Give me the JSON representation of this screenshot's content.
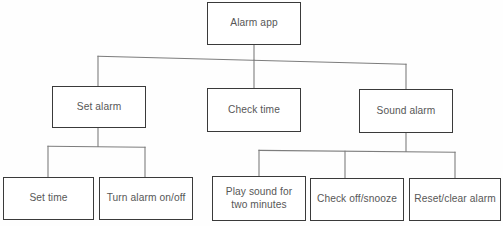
{
  "diagram": {
    "type": "hierarchy-tree",
    "title": "Alarm app",
    "orientation": "top-down",
    "levels": 3,
    "colors": {
      "box_border": "#3a3a3a",
      "box_fill": "#ffffff",
      "text": "#575757",
      "connector": "#7d7d7d",
      "background": "#fefefe"
    },
    "nodes": {
      "root": {
        "label": "Alarm app"
      },
      "set_alarm": {
        "label": "Set alarm"
      },
      "check_time": {
        "label": "Check time"
      },
      "sound_alarm": {
        "label": "Sound alarm"
      },
      "set_time": {
        "label": "Set time"
      },
      "turn_alarm_on_off": {
        "label": "Turn alarm on/off"
      },
      "play_sound": {
        "label": "Play sound for two minutes"
      },
      "check_off_snooze": {
        "label": "Check off/snooze"
      },
      "reset_clear_alarm": {
        "label": "Reset/clear alarm"
      }
    },
    "edges": [
      {
        "from": "root",
        "to": "set_alarm"
      },
      {
        "from": "root",
        "to": "check_time"
      },
      {
        "from": "root",
        "to": "sound_alarm"
      },
      {
        "from": "set_alarm",
        "to": "set_time"
      },
      {
        "from": "set_alarm",
        "to": "turn_alarm_on_off"
      },
      {
        "from": "sound_alarm",
        "to": "play_sound"
      },
      {
        "from": "sound_alarm",
        "to": "check_off_snooze"
      },
      {
        "from": "sound_alarm",
        "to": "reset_clear_alarm"
      }
    ]
  }
}
